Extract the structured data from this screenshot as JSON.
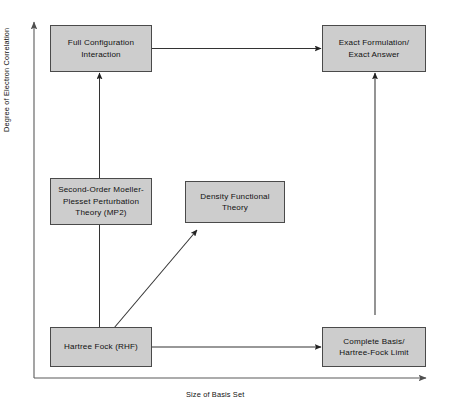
{
  "diagram": {
    "axes": {
      "y_label": "Degree of Electron Correlation",
      "x_label": "Size of Basis Set"
    },
    "colors": {
      "box_fill": "#cdcdcd",
      "box_border": "#4a4a4a",
      "arrow": "#333333",
      "axis": "#555555",
      "text": "#111111",
      "background": "#ffffff"
    },
    "nodes": [
      {
        "id": "full-configuration-interaction",
        "label": "Full Configuration\nInteraction",
        "x": 50,
        "y": 25,
        "width": 102,
        "height": 47
      },
      {
        "id": "exact-formulation",
        "label": "Exact Formulation/\nExact Answer",
        "x": 322,
        "y": 25,
        "width": 104,
        "height": 47
      },
      {
        "id": "mp2",
        "label": "Second-Order Moeller-\nPlesset Perturbation\nTheory (MP2)",
        "x": 50,
        "y": 178,
        "width": 102,
        "height": 47
      },
      {
        "id": "density-functional-theory",
        "label": "Density Functional\nTheory",
        "x": 185,
        "y": 181,
        "width": 100,
        "height": 42
      },
      {
        "id": "hartree-fock",
        "label": "Hartree Fock (RHF)",
        "x": 50,
        "y": 327,
        "width": 102,
        "height": 40
      },
      {
        "id": "complete-basis",
        "label": "Complete Basis/\nHartree-Fock Limit",
        "x": 322,
        "y": 327,
        "width": 104,
        "height": 40
      }
    ],
    "edges": [
      {
        "id": "edge-fci-to-exact",
        "from": "full-configuration-interaction",
        "to": "exact-formulation",
        "kind": "horizontal-arrow"
      },
      {
        "id": "edge-hf-to-complete-basis",
        "from": "hartree-fock",
        "to": "complete-basis",
        "kind": "horizontal-arrow"
      },
      {
        "id": "edge-hf-to-fci",
        "from": "hartree-fock",
        "to": "full-configuration-interaction",
        "kind": "vertical-arrow-through-mp2"
      },
      {
        "id": "edge-complete-basis-to-exact",
        "from": "complete-basis",
        "to": "exact-formulation",
        "kind": "vertical-arrow"
      },
      {
        "id": "edge-hf-to-dft",
        "from": "hartree-fock",
        "to": "density-functional-theory",
        "kind": "diagonal-arrow"
      }
    ]
  }
}
